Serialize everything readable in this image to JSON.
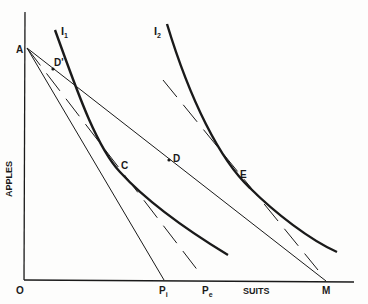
{
  "diagram": {
    "type": "indifference-curve-budget-diagram",
    "axes": {
      "x_label": "SUITS",
      "y_label": "APPLES",
      "origin_label": "O"
    },
    "points": {
      "A": "A",
      "D_prime": "D'",
      "C": "C",
      "D": "D",
      "E": "E",
      "P_i": "P",
      "P_i_sub": "i",
      "P_e": "P",
      "P_e_sub": "e",
      "M": "M"
    },
    "curves": {
      "I1": "I",
      "I1_sub": "1",
      "I2": "I",
      "I2_sub": "2"
    },
    "colors": {
      "ink": "#1a1a1a",
      "background": "#fdfdfc"
    }
  }
}
